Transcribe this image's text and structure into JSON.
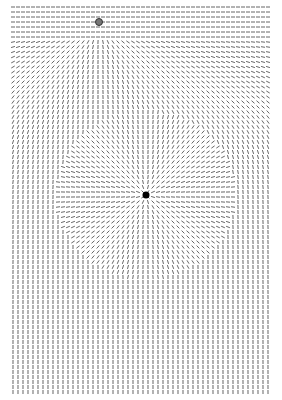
{
  "figure": {
    "type": "orientation-field",
    "width": 282,
    "height": 400,
    "background": "#ffffff",
    "line_color": "#555555",
    "grid": {
      "x_start": 13,
      "y_start": 7,
      "x_end": 270,
      "y_end": 392,
      "step": 5,
      "segment_length": 4
    },
    "small_source": {
      "x": 99,
      "y": 22,
      "radius": 3.5,
      "fill": "#777777",
      "stroke": "#333333"
    },
    "central_disk": {
      "center_x": 146,
      "center_y": 195,
      "radius_x": 90,
      "radius_y": 84,
      "pattern": "radial"
    },
    "center_dot": {
      "x": 146,
      "y": 195,
      "radius": 3.5,
      "fill": "#000000"
    },
    "far_field": "vertical"
  }
}
